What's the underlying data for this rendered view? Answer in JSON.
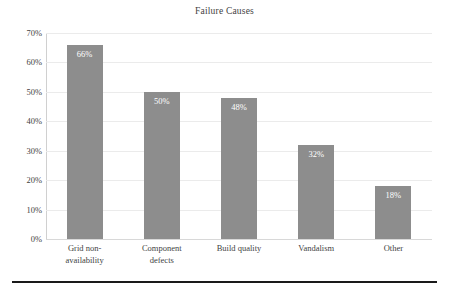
{
  "chart_data": {
    "type": "bar",
    "title": "Failure Causes",
    "xlabel": "",
    "ylabel": "",
    "categories": [
      "Grid non-availability",
      "Component defects",
      "Build quality",
      "Vandalism",
      "Other"
    ],
    "category_lines": [
      [
        "Grid non-",
        "availability"
      ],
      [
        "Component",
        "defects"
      ],
      [
        "Build quality"
      ],
      [
        "Vandalism"
      ],
      [
        "Other"
      ]
    ],
    "values": [
      66,
      50,
      48,
      32,
      18
    ],
    "data_labels": [
      "66%",
      "50%",
      "48%",
      "32%",
      "18%"
    ],
    "ylim": [
      0,
      70
    ],
    "ytick_values": [
      70,
      60,
      50,
      40,
      30,
      20,
      10,
      0
    ],
    "ytick_labels": [
      "70%",
      "60%",
      "50%",
      "40%",
      "30%",
      "20%",
      "10%",
      "0%"
    ],
    "grid": true,
    "legend": false,
    "bar_color": "#8d8d8d",
    "data_label_color": "#ffffff",
    "gridline_color": "#ebebeb",
    "text_color": "#3f3f3f",
    "background_color": "#ffffff"
  }
}
